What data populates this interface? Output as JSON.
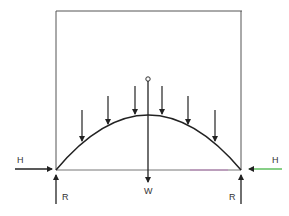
{
  "diagram": {
    "labels": {
      "left_horizontal": "H",
      "right_horizontal": "H",
      "left_vertical": "R",
      "right_vertical": "R",
      "weight": "W"
    },
    "load_arrows_count": 6,
    "colors": {
      "line": "#2a2a2a",
      "frame": "#555555",
      "right_h_arrow": "#5fbf5f",
      "base_tint": "#c060c0"
    }
  }
}
